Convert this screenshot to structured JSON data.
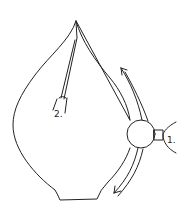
{
  "diagram": {
    "type": "line-drawing",
    "stroke_color": "#222222",
    "background_color": "#ffffff",
    "labels": {
      "part_1": "1.",
      "part_2": "2."
    },
    "arrows": [
      {
        "name": "upper-flow-arrow",
        "direction": "up-left"
      },
      {
        "name": "lower-flow-arrow",
        "direction": "down-left"
      }
    ]
  }
}
